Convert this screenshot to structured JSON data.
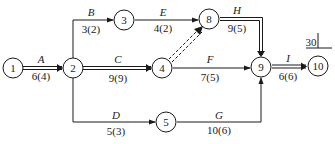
{
  "diagram": {
    "type": "activity-on-arrow network (double-code network)",
    "nodes": [
      {
        "id": "1",
        "label": "1"
      },
      {
        "id": "2",
        "label": "2"
      },
      {
        "id": "3",
        "label": "3"
      },
      {
        "id": "4",
        "label": "4"
      },
      {
        "id": "5",
        "label": "5"
      },
      {
        "id": "8",
        "label": "8"
      },
      {
        "id": "9",
        "label": "9"
      },
      {
        "id": "10",
        "label": "10"
      }
    ],
    "activities": [
      {
        "name": "A",
        "from": "1",
        "to": "2",
        "duration": "6(4)",
        "critical": true
      },
      {
        "name": "B",
        "from": "2",
        "to": "3",
        "duration": "3(2)",
        "critical": false
      },
      {
        "name": "C",
        "from": "2",
        "to": "4",
        "duration": "9(9)",
        "critical": true
      },
      {
        "name": "D",
        "from": "2",
        "to": "5",
        "duration": "5(3)",
        "critical": false
      },
      {
        "name": "E",
        "from": "3",
        "to": "8",
        "duration": "4(2)",
        "critical": false
      },
      {
        "name": "F",
        "from": "4",
        "to": "9",
        "duration": "7(5)",
        "critical": false
      },
      {
        "name": "G",
        "from": "5",
        "to": "9",
        "duration": "10(6)",
        "critical": false
      },
      {
        "name": "H",
        "from": "8",
        "to": "9",
        "duration": "9(5)",
        "critical": true
      },
      {
        "name": "I",
        "from": "9",
        "to": "10",
        "duration": "6(6)",
        "critical": true
      }
    ],
    "dummy_activities": [
      {
        "from": "4",
        "to": "8",
        "critical": true
      }
    ],
    "total_duration_label": "30"
  }
}
